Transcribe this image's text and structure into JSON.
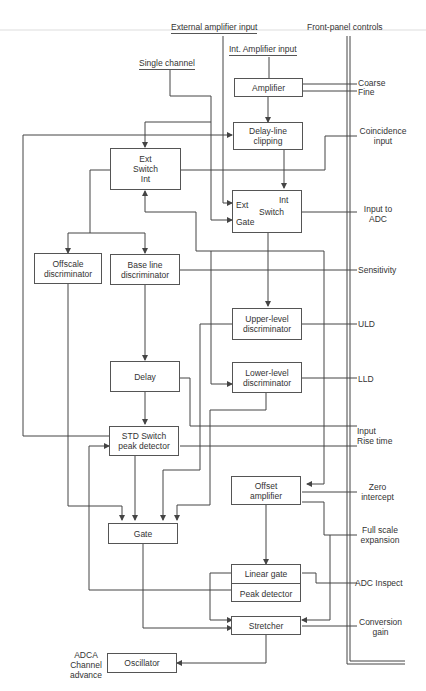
{
  "header": {
    "external_input": "External amplifier input",
    "front_panel": "Front-panel controls",
    "int_input": "Int. Amplifier input",
    "single_channel": "Single channel"
  },
  "blocks": {
    "amplifier": "Amplifier",
    "delay_line_1": "Delay-line",
    "delay_line_2": "clipping",
    "ext_switch_1": "Ext",
    "ext_switch_2": "Switch",
    "ext_switch_3": "Int",
    "int_switch_int": "Int",
    "int_switch_ext": "Ext",
    "int_switch_label": "Switch",
    "int_switch_gate": "Gate",
    "offscale_1": "Offscale",
    "offscale_2": "discriminator",
    "baseline_1": "Base line",
    "baseline_2": "discriminator",
    "uld_1": "Upper-level",
    "uld_2": "discriminator",
    "lld_1": "Lower-level",
    "lld_2": "discriminator",
    "delay": "Delay",
    "std_1": "STD Switch",
    "std_2": "peak detector",
    "offset_1": "Offset",
    "offset_2": "amplifier",
    "gate": "Gate",
    "linear_gate": "Linear gate",
    "peak_detector": "Peak detector",
    "stretcher": "Stretcher",
    "oscillator": "Oscillator"
  },
  "controls": {
    "coarse": "Coarse",
    "fine": "Fine",
    "coincidence_1": "Coincidence",
    "coincidence_2": "input",
    "input_adc_1": "Input to",
    "input_adc_2": "ADC",
    "sensitivity": "Sensitivity",
    "uld": "ULD",
    "lld": "LLD",
    "rise_1": "Input",
    "rise_2": "Rise time",
    "zero_1": "Zero",
    "zero_2": "intercept",
    "full_1": "Full scale",
    "full_2": "expansion",
    "adc_inspect": "ADC Inspect",
    "conv_1": "Conversion",
    "conv_2": "gain"
  },
  "output": {
    "adca_1": "ADCA",
    "adca_2": "Channel",
    "adca_3": "advance"
  }
}
